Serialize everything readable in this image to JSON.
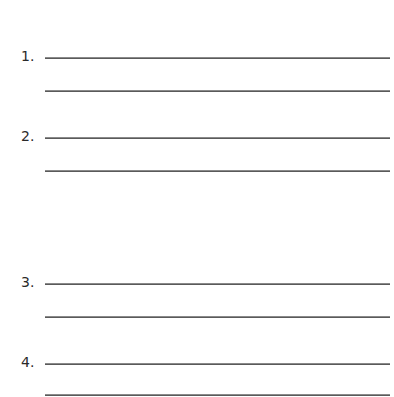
{
  "worksheet": {
    "items": [
      {
        "label": "1.",
        "lines": 2
      },
      {
        "label": "2.",
        "lines": 2
      },
      {
        "label": "3.",
        "lines": 2
      },
      {
        "label": "4.",
        "lines": 2
      }
    ]
  }
}
